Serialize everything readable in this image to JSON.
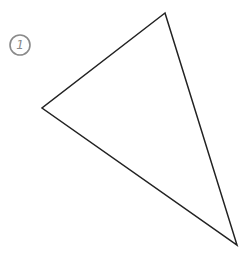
{
  "diagram": {
    "label": {
      "text": "1",
      "cx": 20,
      "cy": 45,
      "r": 10,
      "color": "#8a8a8a"
    },
    "triangle": {
      "vertices": [
        [
          165,
          13
        ],
        [
          42,
          108
        ],
        [
          237,
          245
        ]
      ],
      "stroke": "#222222",
      "stroke_width": 1.5
    }
  }
}
